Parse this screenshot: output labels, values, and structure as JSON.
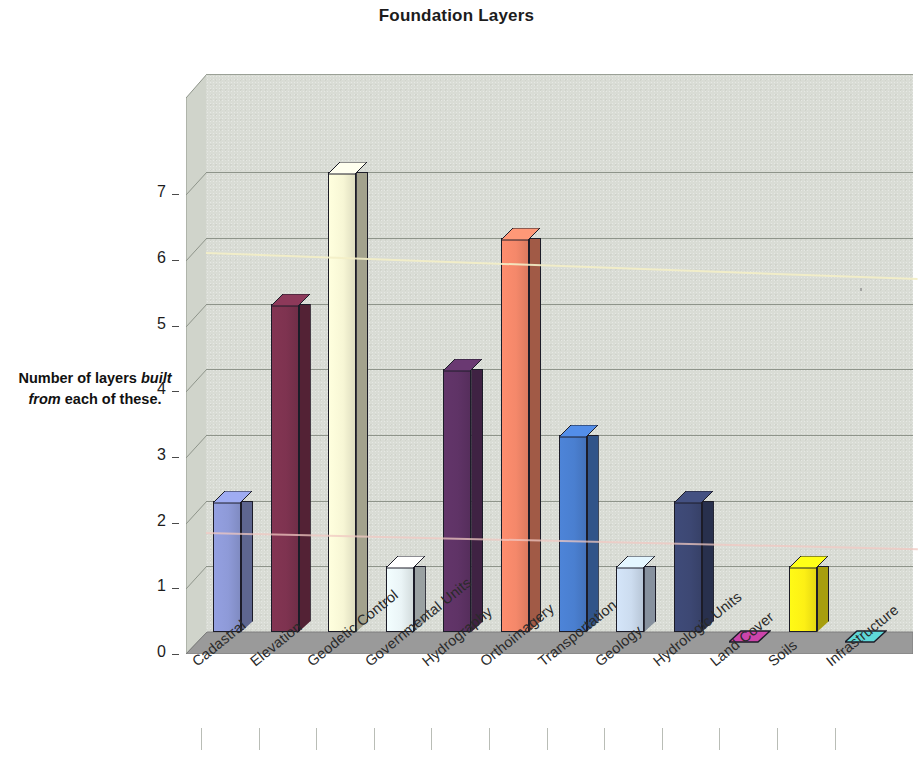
{
  "chart_data": {
    "type": "bar",
    "title": "Foundation Layers",
    "subtitle": "",
    "xlabel": "",
    "ylabel": "Number of layers built from each of these.",
    "ylabel_parts": [
      {
        "text": "Number of layers ",
        "italic": false
      },
      {
        "text": "built",
        "italic": true
      },
      {
        "text": " ",
        "italic": false
      },
      {
        "text": "from",
        "italic": true
      },
      {
        "text": " each of these.",
        "italic": false
      }
    ],
    "ylim": [
      0,
      7
    ],
    "yticks": [
      0,
      1,
      2,
      3,
      4,
      5,
      6,
      7
    ],
    "grid": true,
    "legend": "none",
    "style": "3d-column",
    "categories": [
      "Cadastral",
      "Elevation",
      "Geodetic Control",
      "Governmental Units",
      "Hydrography",
      "Orthoimagery",
      "Transportation",
      "Geology",
      "Hydrologic Units",
      "Land Cover",
      "Soils",
      "Infrastructure"
    ],
    "values": [
      2,
      5,
      7,
      1,
      4,
      6,
      3,
      1,
      2,
      0,
      1,
      0
    ],
    "colors": [
      "#8e9ad8",
      "#7e3350",
      "#f7f6d5",
      "#eaf4f6",
      "#5f3366",
      "#f4886a",
      "#4a7fd0",
      "#ccdcef",
      "#3d4874",
      "#cc44aa",
      "#fdf015",
      "#5fd8d8"
    ],
    "plot_background": "#d9dcd5",
    "floor_color": "#9a9a9a",
    "gridline_color": "#8e948a",
    "annotations": [
      {
        "name": "scan-artifact-yellow",
        "color": "#f4f0c8"
      },
      {
        "name": "scan-artifact-pink",
        "color": "#f3c9c4"
      }
    ]
  }
}
